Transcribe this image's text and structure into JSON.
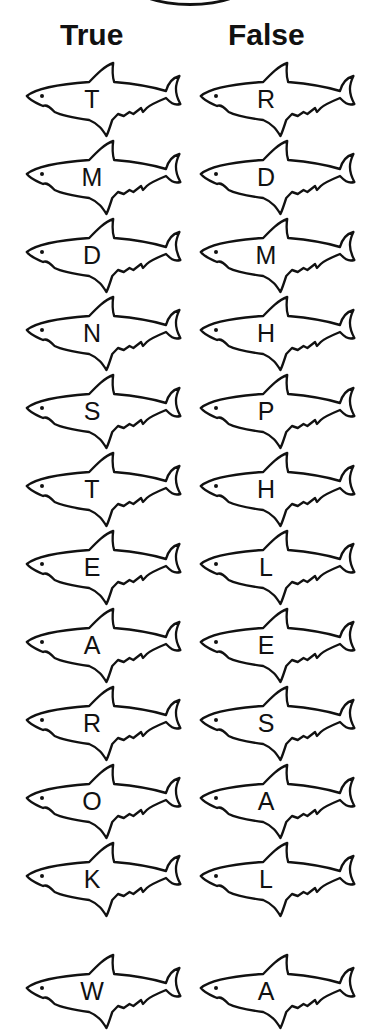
{
  "headers": {
    "true_label": "True",
    "false_label": "False"
  },
  "rows": [
    {
      "true": "T",
      "false": "R"
    },
    {
      "true": "M",
      "false": "D"
    },
    {
      "true": "D",
      "false": "M"
    },
    {
      "true": "N",
      "false": "H"
    },
    {
      "true": "S",
      "false": "P"
    },
    {
      "true": "T",
      "false": "H"
    },
    {
      "true": "E",
      "false": "L"
    },
    {
      "true": "A",
      "false": "E"
    },
    {
      "true": "R",
      "false": "S"
    },
    {
      "true": "O",
      "false": "A"
    },
    {
      "true": "K",
      "false": "L"
    },
    {
      "true": "W",
      "false": "A"
    }
  ]
}
